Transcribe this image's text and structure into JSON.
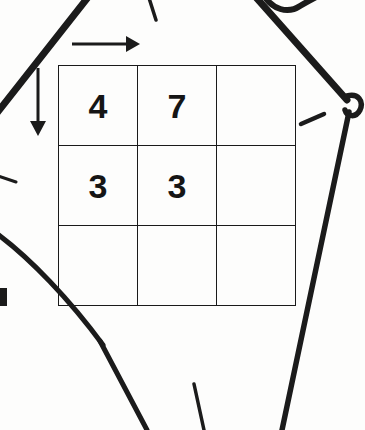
{
  "page": {
    "title": "Scanned puzzle grid worksheet",
    "background_color": "#fdfdfc",
    "ink_color": "#151515",
    "width": 365,
    "height": 430
  },
  "grid": {
    "rows": 3,
    "cols": 3,
    "cells": [
      [
        {
          "value": "4",
          "highlight": false
        },
        {
          "value": "7",
          "highlight": false
        },
        {
          "value": "",
          "highlight": false
        }
      ],
      [
        {
          "value": "3",
          "highlight": false
        },
        {
          "value": "3",
          "highlight": false
        },
        {
          "value": "",
          "highlight": false
        }
      ],
      [
        {
          "value": "",
          "highlight": false
        },
        {
          "value": "",
          "highlight": false
        },
        {
          "value": "",
          "highlight": true
        }
      ]
    ],
    "border_color": "#1a1a1a",
    "highlight_border_color": "#121212"
  },
  "annotations": {
    "arrow_right": {
      "name": "column-direction-arrow",
      "direction": "right"
    },
    "arrow_down": {
      "name": "row-direction-arrow",
      "direction": "down"
    },
    "tick_right": {
      "name": "right-side-tick-mark"
    },
    "tick_left": {
      "name": "left-side-tick-mark"
    },
    "tick_top": {
      "name": "top-center-tick-mark"
    },
    "tick_bottom": {
      "name": "bottom-center-tick-mark"
    },
    "mark_bottom_left": {
      "name": "bottom-left-ink-blob"
    }
  },
  "ink_strokes": {
    "diagonal_top_left": {
      "name": "diagonal-stroke-top-left"
    },
    "diagonal_top_right": {
      "name": "diagonal-stroke-top-right"
    },
    "diagonal_bottom_left": {
      "name": "diagonal-stroke-bottom-left"
    },
    "diagonal_bottom_right": {
      "name": "diagonal-stroke-bottom-right"
    },
    "vertex_loop": {
      "name": "vertex-loop-knot"
    },
    "hook_top_right": {
      "name": "hook-squiggle-top-right"
    },
    "curve_left": {
      "name": "curve-stroke-left"
    }
  }
}
